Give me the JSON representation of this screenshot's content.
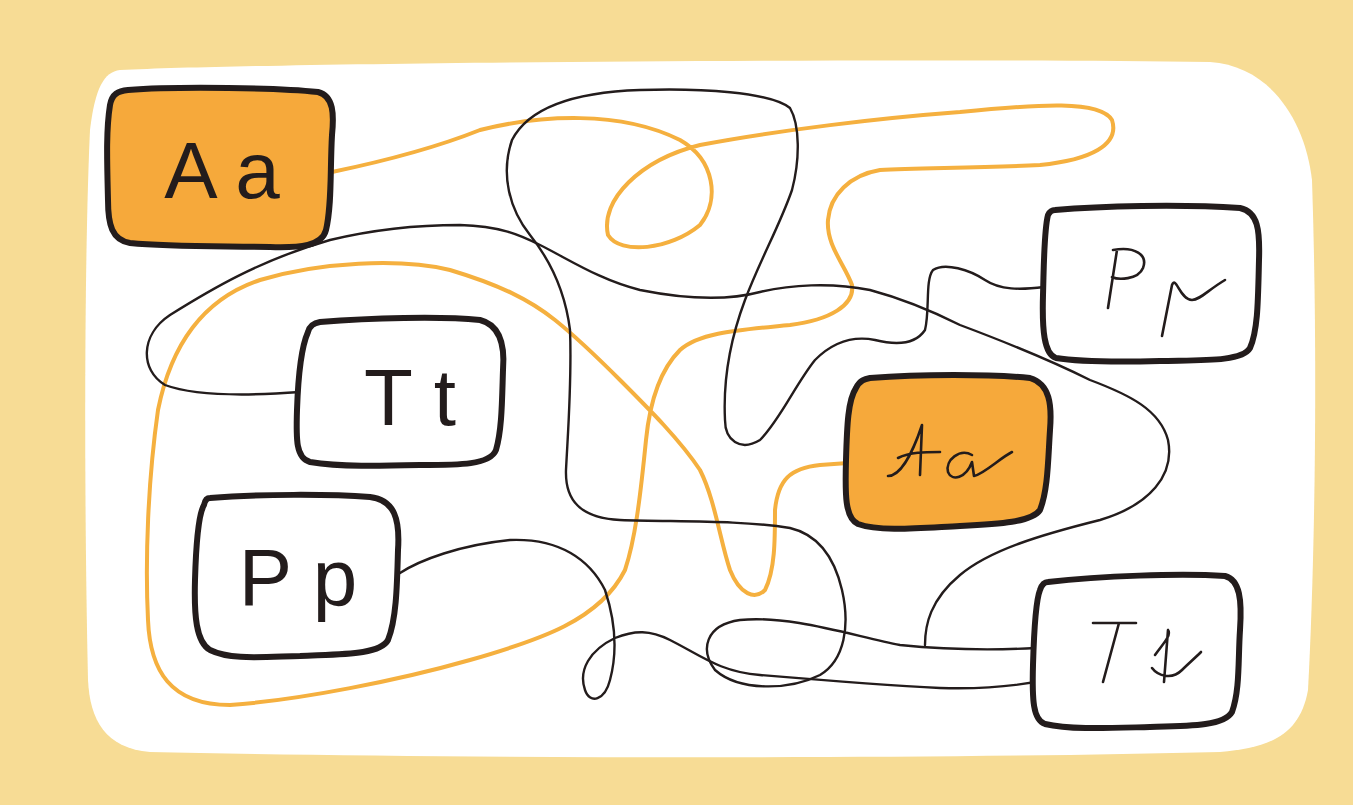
{
  "colors": {
    "background": "#f7dc95",
    "panel": "#ffffff",
    "orange_fill": "#f6a93b",
    "orange_line": "#f5b03f",
    "ink": "#231c1c"
  },
  "puzzle": {
    "description": "Letter maze: follow each line from a printed letter box to its matching cursive letter box",
    "boxes": [
      {
        "id": "print-aa",
        "label": "A a",
        "style": "print",
        "filled": true
      },
      {
        "id": "print-tt",
        "label": "T t",
        "style": "print",
        "filled": false
      },
      {
        "id": "print-pp",
        "label": "P p",
        "style": "print",
        "filled": false
      },
      {
        "id": "cursive-pp",
        "label": "P p",
        "style": "cursive",
        "filled": false
      },
      {
        "id": "cursive-aa",
        "label": "A a",
        "style": "cursive",
        "filled": true
      },
      {
        "id": "cursive-tt",
        "label": "T t",
        "style": "cursive",
        "filled": false
      }
    ],
    "lines": [
      {
        "from": "print-aa",
        "to": "cursive-aa",
        "color": "orange"
      },
      {
        "from": "print-tt",
        "to": "cursive-pp",
        "color": "black"
      },
      {
        "from": "print-pp",
        "to": "cursive-tt",
        "color": "black"
      }
    ]
  }
}
